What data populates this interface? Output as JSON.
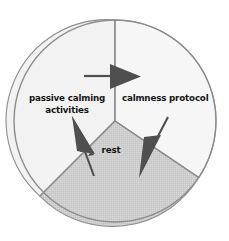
{
  "diagram": {
    "type": "pie-sector-diagram",
    "shape": "circle",
    "center": {
      "x": 115,
      "y": 121
    },
    "radius": 101,
    "outline_color": "#8d8d8d",
    "divider_color": "#8d8d8d",
    "background": "#ffffff",
    "sectors": [
      {
        "id": "passive-calming-activities",
        "label": "passive calming\nactivities",
        "fill": "#f1f1f1",
        "start_angle_deg": 222,
        "end_angle_deg": 360
      },
      {
        "id": "calmness-protocol",
        "label": "calmness protocol",
        "fill": "#f6f6f6",
        "start_angle_deg": 0,
        "end_angle_deg": 326
      },
      {
        "id": "rest",
        "label": "rest",
        "fill": "#cdcdcd",
        "start_angle_deg": 326,
        "end_angle_deg": 222
      }
    ],
    "arrows": [
      {
        "id": "arrow-right-into-calmness-protocol",
        "direction": "right",
        "fill": "#4f4f4f",
        "tail_color": "#4f4f4f"
      },
      {
        "id": "arrow-up-left-into-passive-calming",
        "direction": "up-left",
        "fill": "#4f4f4f",
        "tail_color": "#4f4f4f"
      },
      {
        "id": "arrow-down-left-into-rest",
        "direction": "down-left",
        "fill": "#4f4f4f",
        "tail_color": "#4f4f4f"
      }
    ]
  },
  "labels": {
    "passive": "passive calming\nactivities",
    "calmness": "calmness protocol",
    "rest": "rest"
  }
}
